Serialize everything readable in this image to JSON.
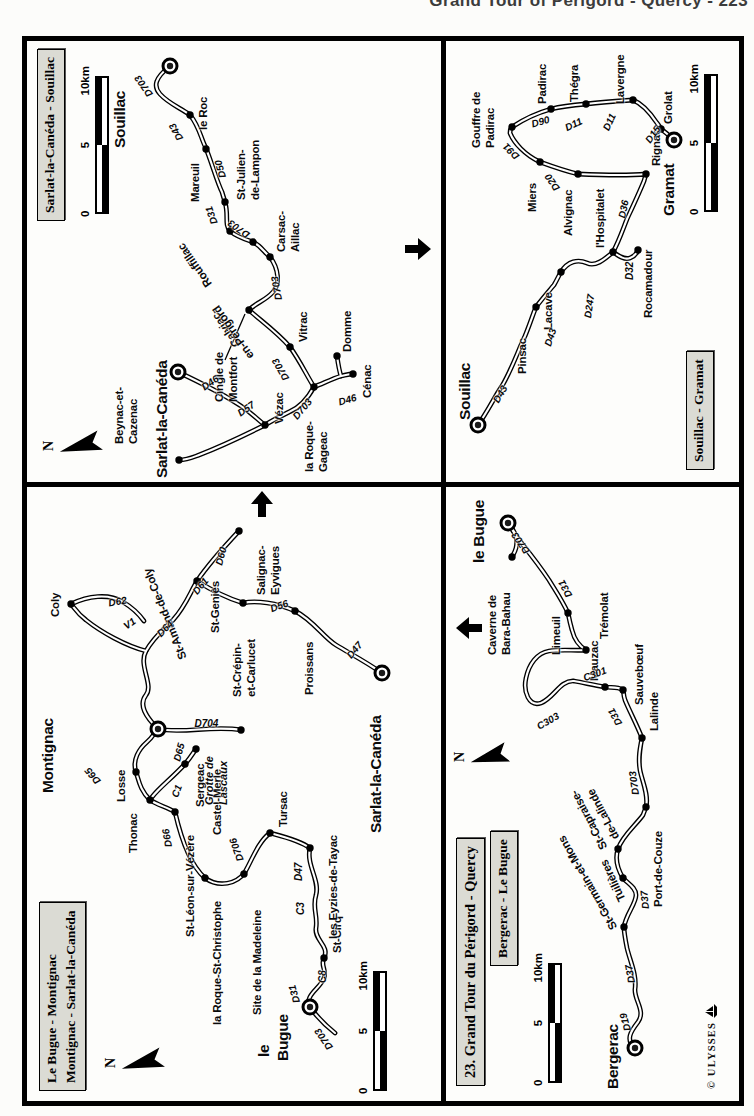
{
  "header": "Grand Tour of Périgord - Quercy - 223",
  "credit": "© ULYSSES",
  "colors": {
    "ink": "#000000",
    "paper": "#fdfdfb",
    "title_box": "#dbdbd4"
  },
  "maps": {
    "q1": {
      "name": "le-bugue-montignac-sarlat",
      "titles": [
        "Le Bugue - Montignac",
        "Montignac - Sarlat-la-Canéda"
      ],
      "scale": [
        "0",
        "5",
        "10km"
      ],
      "compass": "N",
      "towns": [
        {
          "n": "le Bugue",
          "x": 94,
          "y": 283,
          "k": "big"
        },
        {
          "n": "Montignac",
          "x": 372,
          "y": 131,
          "k": "big"
        },
        {
          "n": "Sarlat-la-Canéda",
          "x": 428,
          "y": 355,
          "k": "big"
        },
        {
          "n": "St-Cirq",
          "x": 143,
          "y": 297
        },
        {
          "n": "les Eyzies-de-Tayac",
          "x": 253,
          "y": 283
        },
        {
          "n": "Tursac",
          "x": 268,
          "y": 243
        },
        {
          "n": "Site de la Madeleine",
          "x": 227,
          "y": 217
        },
        {
          "n": "la Roque-St-Christophe",
          "x": 223,
          "y": 178
        },
        {
          "n": "St-Léon-sur-Vézère",
          "x": 289,
          "y": 148
        },
        {
          "n": "Thonac",
          "x": 301,
          "y": 123
        },
        {
          "n": "Losse",
          "x": 329,
          "y": 109
        },
        {
          "n": "Sergeac",
          "x": 337,
          "y": 158
        },
        {
          "n": "Castel-Merle",
          "x": 352,
          "y": 169
        },
        {
          "n": "Grotte de Lascaux",
          "x": 371,
          "y": 214
        },
        {
          "n": "Coly",
          "x": 497,
          "y": 44
        },
        {
          "n": "St-Geniès",
          "x": 520,
          "y": 170
        },
        {
          "n": "St-Crépin-et-Carlucet",
          "x": 498,
          "y": 216
        },
        {
          "n": "Salignac-Eyvigues",
          "x": 570,
          "y": 212
        },
        {
          "n": "Proissans",
          "x": 490,
          "y": 268
        }
      ],
      "labels": [
        {
          "t": "le",
          "x": 44,
          "y": 228,
          "c": "big"
        },
        {
          "t": "Bugue",
          "x": 40,
          "y": 247,
          "c": "big"
        },
        {
          "t": "Montignac",
          "x": 308,
          "y": 12,
          "c": "big"
        },
        {
          "t": "Sarlat-la-Canéda",
          "x": 268,
          "y": 340,
          "c": "big"
        },
        {
          "t": "St-Cirq",
          "x": 148,
          "y": 304
        },
        {
          "t": "les Eyzies-de-Tayac",
          "x": 162,
          "y": 300
        },
        {
          "t": "Tursac",
          "x": 274,
          "y": 250
        },
        {
          "t": "Site de la Madeleine",
          "x": 86,
          "y": 224
        },
        {
          "t": "la Roque-St-Christophe",
          "x": 76,
          "y": 184
        },
        {
          "t": "St-Léon-sur-Vézère",
          "x": 164,
          "y": 157
        },
        {
          "t": "Thonac",
          "x": 248,
          "y": 100
        },
        {
          "t": "Losse",
          "x": 299,
          "y": 88
        },
        {
          "t": "Sergeac",
          "x": 294,
          "y": 167
        },
        {
          "t": "Castel-Merle",
          "x": 266,
          "y": 184
        },
        {
          "t": "Coly",
          "x": 484,
          "y": 22
        },
        {
          "t": "St-Amand-de-Coly",
          "x": 442,
          "y": 150,
          "r": -22
        },
        {
          "t": "St-Geniès",
          "x": 468,
          "y": 182
        },
        {
          "t": "Salignac-",
          "x": 506,
          "y": 228
        },
        {
          "t": "Eyvigues",
          "x": 506,
          "y": 242
        },
        {
          "t": "St-Crépin-",
          "x": 404,
          "y": 204
        },
        {
          "t": "et-Carlucet",
          "x": 404,
          "y": 218
        },
        {
          "t": "Proissans",
          "x": 406,
          "y": 276
        },
        {
          "t": "Grotte de",
          "x": 296,
          "y": 176,
          "c": "site"
        },
        {
          "t": "Lascaux",
          "x": 296,
          "y": 190,
          "c": "site"
        },
        {
          "t": "D703",
          "x": 52,
          "y": 298,
          "c": "road",
          "r": -35
        },
        {
          "t": "D31",
          "x": 98,
          "y": 264,
          "c": "road",
          "r": -15
        },
        {
          "t": "C8",
          "x": 118,
          "y": 290,
          "c": "road"
        },
        {
          "t": "C3",
          "x": 186,
          "y": 268,
          "c": "road"
        },
        {
          "t": "D47",
          "x": 220,
          "y": 266,
          "c": "road"
        },
        {
          "t": "D706",
          "x": 240,
          "y": 208,
          "c": "road",
          "r": -20
        },
        {
          "t": "D66",
          "x": 254,
          "y": 136,
          "c": "road",
          "r": -10
        },
        {
          "t": "C1",
          "x": 304,
          "y": 142,
          "c": "road",
          "r": 20
        },
        {
          "t": "D65",
          "x": 340,
          "y": 144,
          "c": "road",
          "r": 15
        },
        {
          "t": "D65",
          "x": 318,
          "y": 66,
          "c": "road",
          "r": -40
        },
        {
          "t": "D704",
          "x": 378,
          "y": 162,
          "c": "road",
          "r": 90
        },
        {
          "t": "D62",
          "x": 498,
          "y": 76,
          "c": "road",
          "r": 80
        },
        {
          "t": "V1",
          "x": 474,
          "y": 92,
          "c": "road",
          "r": 55
        },
        {
          "t": "D64",
          "x": 466,
          "y": 126,
          "c": "road",
          "r": 45
        },
        {
          "t": "D61",
          "x": 508,
          "y": 162,
          "c": "road",
          "r": 40
        },
        {
          "t": "D60",
          "x": 536,
          "y": 186,
          "c": "road",
          "r": 15
        },
        {
          "t": "D56",
          "x": 492,
          "y": 238,
          "c": "road",
          "r": 70
        },
        {
          "t": "D47",
          "x": 444,
          "y": 316,
          "c": "road",
          "r": 40
        }
      ]
    },
    "q2": {
      "name": "sarlat-souillac",
      "titles": [
        "Sarlat-la-Canéda - Souillac"
      ],
      "scale": [
        "0",
        "5",
        "10km"
      ],
      "compass": "N",
      "towns": [
        {
          "n": "Souillac",
          "x": 416,
          "y": 143,
          "k": "big"
        },
        {
          "n": "Sarlat-la-Canéda",
          "x": 110,
          "y": 151,
          "k": "big"
        },
        {
          "n": "le Roc",
          "x": 367,
          "y": 163
        },
        {
          "n": "Mareuil",
          "x": 333,
          "y": 179
        },
        {
          "n": "St-Julien-de-Lampon",
          "x": 280,
          "y": 198
        },
        {
          "n": "Rouffillac",
          "x": 251,
          "y": 203
        },
        {
          "n": "Calviac-en-Périgord",
          "x": 240,
          "y": 226
        },
        {
          "n": "Carsac-Aillac",
          "x": 225,
          "y": 243
        },
        {
          "n": "Cingle de Montfort",
          "x": 172,
          "y": 222
        },
        {
          "n": "Vitrac",
          "x": 135,
          "y": 263
        },
        {
          "n": "la Roque-Gageac",
          "x": 95,
          "y": 287
        },
        {
          "n": "Cénac",
          "x": 108,
          "y": 326
        },
        {
          "n": "Domme",
          "x": 126,
          "y": 310
        },
        {
          "n": "Vézac",
          "x": 57,
          "y": 238
        },
        {
          "n": "Beynac-et-Cazenac",
          "x": 22,
          "y": 152
        }
      ],
      "labels": [
        {
          "t": "Souillac",
          "x": 334,
          "y": 84,
          "c": "big"
        },
        {
          "t": "Sarlat-la-Canéda",
          "x": 4,
          "y": 126,
          "c": "big"
        },
        {
          "t": "le Roc",
          "x": 352,
          "y": 170
        },
        {
          "t": "Mareuil",
          "x": 280,
          "y": 162
        },
        {
          "t": "St-Julien-",
          "x": 282,
          "y": 208
        },
        {
          "t": "de-Lampon",
          "x": 282,
          "y": 222
        },
        {
          "t": "Rouffillac",
          "x": 196,
          "y": 176,
          "r": -35
        },
        {
          "t": "Calviac-",
          "x": 136,
          "y": 204,
          "r": -35
        },
        {
          "t": "en-Périgord",
          "x": 124,
          "y": 218,
          "r": -35
        },
        {
          "t": "Carsac-",
          "x": 230,
          "y": 248
        },
        {
          "t": "Aillac",
          "x": 230,
          "y": 262
        },
        {
          "t": "Cingle de",
          "x": 80,
          "y": 186
        },
        {
          "t": "Montfort",
          "x": 80,
          "y": 200
        },
        {
          "t": "Vitrac",
          "x": 140,
          "y": 270
        },
        {
          "t": "Domme",
          "x": 130,
          "y": 314
        },
        {
          "t": "Cénac",
          "x": 84,
          "y": 334
        },
        {
          "t": "la Roque-",
          "x": 10,
          "y": 276
        },
        {
          "t": "Gageac",
          "x": 10,
          "y": 290
        },
        {
          "t": "Vézac",
          "x": 58,
          "y": 246
        },
        {
          "t": "Beynac-et-",
          "x": 38,
          "y": 86
        },
        {
          "t": "Cazenac",
          "x": 38,
          "y": 100
        },
        {
          "t": "D703",
          "x": 386,
          "y": 118,
          "c": "road",
          "r": -35
        },
        {
          "t": "D43",
          "x": 342,
          "y": 148,
          "c": "road",
          "r": -30
        },
        {
          "t": "D50",
          "x": 304,
          "y": 190,
          "c": "road",
          "r": -15
        },
        {
          "t": "D31",
          "x": 258,
          "y": 182,
          "c": "road",
          "r": -20
        },
        {
          "t": "D703",
          "x": 246,
          "y": 216,
          "c": "road",
          "r": -55
        },
        {
          "t": "D703",
          "x": 182,
          "y": 246,
          "c": "road",
          "r": -10
        },
        {
          "t": "D703",
          "x": 102,
          "y": 254,
          "c": "road",
          "r": -30
        },
        {
          "t": "D703",
          "x": 64,
          "y": 262,
          "c": "road",
          "r": 40
        },
        {
          "t": "D46",
          "x": 94,
          "y": 170,
          "c": "road",
          "r": 55
        },
        {
          "t": "D57",
          "x": 68,
          "y": 206,
          "c": "road",
          "r": 55
        },
        {
          "t": "D46",
          "x": 80,
          "y": 306,
          "c": "road",
          "r": 75
        }
      ]
    },
    "q3": {
      "name": "bergerac-le-bugue",
      "titles": [
        "23. Grand Tour du Périgord - Quercy",
        "Bergerac - Le Bugue"
      ],
      "scale": [
        "0",
        "5",
        "10km"
      ],
      "compass": "N",
      "towns": [
        {
          "n": "Bergerac",
          "x": 53,
          "y": 189,
          "k": "big"
        },
        {
          "n": "le Bugue",
          "x": 578,
          "y": 62,
          "k": "big"
        },
        {
          "n": "St-Germain-et-Mons",
          "x": 174,
          "y": 178
        },
        {
          "n": "Tuilières",
          "x": 223,
          "y": 177
        },
        {
          "n": "St-Capraise-de-Lalinde",
          "x": 252,
          "y": 172
        },
        {
          "n": "Port-de-Couze",
          "x": 294,
          "y": 200
        },
        {
          "n": "Lalinde",
          "x": 363,
          "y": 196
        },
        {
          "n": "Sauvebœuf",
          "x": 411,
          "y": 177
        },
        {
          "n": "Mauzac",
          "x": 414,
          "y": 159
        },
        {
          "n": "Trémolat",
          "x": 451,
          "y": 140
        },
        {
          "n": "Limeuil",
          "x": 488,
          "y": 122
        },
        {
          "n": "Caverne de Bara-Bahau",
          "x": 544,
          "y": 66
        }
      ],
      "labels": [
        {
          "t": "Bergerac",
          "x": 12,
          "y": 158,
          "c": "big"
        },
        {
          "t": "le Bugue",
          "x": 538,
          "y": 24,
          "c": "big"
        },
        {
          "t": "St-Germain-et-Mons",
          "x": 172,
          "y": 162,
          "r": -30
        },
        {
          "t": "Tuilières",
          "x": 200,
          "y": 170,
          "r": -25
        },
        {
          "t": "St-Capraise-",
          "x": 252,
          "y": 152,
          "r": -28
        },
        {
          "t": "de-Lalinde",
          "x": 262,
          "y": 164,
          "r": -28
        },
        {
          "t": "Port-de-Couze",
          "x": 194,
          "y": 206
        },
        {
          "t": "Lalinde",
          "x": 370,
          "y": 202
        },
        {
          "t": "Sauvebœuf",
          "x": 396,
          "y": 187
        },
        {
          "t": "Mauzac",
          "x": 420,
          "y": 142
        },
        {
          "t": "Trémolat",
          "x": 462,
          "y": 152
        },
        {
          "t": "Limeuil",
          "x": 446,
          "y": 104
        },
        {
          "t": "Caverne de",
          "x": 446,
          "y": 40
        },
        {
          "t": "Bara-Bahau",
          "x": 446,
          "y": 54
        },
        {
          "t": "D19",
          "x": 70,
          "y": 176,
          "c": "road",
          "r": -15
        },
        {
          "t": "D37",
          "x": 118,
          "y": 180,
          "c": "road",
          "r": -10
        },
        {
          "t": "D37",
          "x": 192,
          "y": 194,
          "c": "road",
          "r": -5
        },
        {
          "t": "D703",
          "x": 306,
          "y": 184,
          "c": "road",
          "r": -8
        },
        {
          "t": "D31",
          "x": 376,
          "y": 168,
          "c": "road",
          "r": -30
        },
        {
          "t": "C301",
          "x": 423,
          "y": 132,
          "c": "road",
          "r": 70
        },
        {
          "t": "C303",
          "x": 374,
          "y": 86,
          "c": "road",
          "r": 60
        },
        {
          "t": "D31",
          "x": 504,
          "y": 118,
          "c": "road",
          "r": -28
        },
        {
          "t": "D703",
          "x": 548,
          "y": 76,
          "c": "road",
          "r": -35
        }
      ]
    },
    "q4": {
      "name": "souillac-gramat",
      "titles": [
        "Souillac - Gramat"
      ],
      "scale": [
        "0",
        "5",
        "10km"
      ],
      "towns": [
        {
          "n": "Souillac",
          "x": 57,
          "y": 32,
          "k": "big"
        },
        {
          "n": "Gramat",
          "x": 342,
          "y": 228,
          "k": "big"
        },
        {
          "n": "Pinsac",
          "x": 175,
          "y": 90
        },
        {
          "n": "Lacave",
          "x": 210,
          "y": 115
        },
        {
          "n": "l'Hospitalet",
          "x": 230,
          "y": 167
        },
        {
          "n": "Rocamadour",
          "x": 232,
          "y": 192
        },
        {
          "n": "Rignac",
          "x": 308,
          "y": 200
        },
        {
          "n": "Alvignac",
          "x": 308,
          "y": 132
        },
        {
          "n": "Miers",
          "x": 320,
          "y": 94
        },
        {
          "n": "Gouffre de Padirac",
          "x": 355,
          "y": 66
        },
        {
          "n": "Padirac",
          "x": 373,
          "y": 105
        },
        {
          "n": "Thégra",
          "x": 378,
          "y": 140
        },
        {
          "n": "Lavergne",
          "x": 382,
          "y": 187
        },
        {
          "n": "Grolat",
          "x": 353,
          "y": 215
        }
      ],
      "labels": [
        {
          "t": "Souillac",
          "x": 62,
          "y": 10,
          "c": "big"
        },
        {
          "t": "Gramat",
          "x": 266,
          "y": 214,
          "c": "big"
        },
        {
          "t": "Pinsac",
          "x": 108,
          "y": 70
        },
        {
          "t": "Lacave",
          "x": 152,
          "y": 96
        },
        {
          "t": "l'Hospitalet",
          "x": 234,
          "y": 148
        },
        {
          "t": "Rocamadour",
          "x": 164,
          "y": 196
        },
        {
          "t": "Rignac",
          "x": 316,
          "y": 204
        },
        {
          "t": "Alvignac",
          "x": 246,
          "y": 116
        },
        {
          "t": "Miers",
          "x": 270,
          "y": 80
        },
        {
          "t": "Gouffre de",
          "x": 334,
          "y": 24
        },
        {
          "t": "Padirac",
          "x": 334,
          "y": 38
        },
        {
          "t": "Padirac",
          "x": 378,
          "y": 90
        },
        {
          "t": "Thégra",
          "x": 380,
          "y": 122
        },
        {
          "t": "Lavergne",
          "x": 378,
          "y": 168
        },
        {
          "t": "Grolat",
          "x": 358,
          "y": 216
        },
        {
          "t": "D43",
          "x": 80,
          "y": 44,
          "c": "road",
          "r": 30
        },
        {
          "t": "D43",
          "x": 136,
          "y": 96,
          "c": "road",
          "r": 18
        },
        {
          "t": "D247",
          "x": 164,
          "y": 136,
          "c": "road",
          "r": 8
        },
        {
          "t": "D32",
          "x": 202,
          "y": 178,
          "c": "road"
        },
        {
          "t": "D36",
          "x": 264,
          "y": 170,
          "c": "road",
          "r": 12
        },
        {
          "t": "D20",
          "x": 292,
          "y": 106,
          "c": "road",
          "r": -35
        },
        {
          "t": "D91",
          "x": 324,
          "y": 66,
          "c": "road",
          "r": -45
        },
        {
          "t": "D90",
          "x": 358,
          "y": 80,
          "c": "road",
          "r": 75
        },
        {
          "t": "D11",
          "x": 354,
          "y": 114,
          "c": "road",
          "r": 65
        },
        {
          "t": "D11",
          "x": 352,
          "y": 154,
          "c": "road",
          "r": 25
        },
        {
          "t": "D15",
          "x": 340,
          "y": 196,
          "c": "road",
          "r": 35
        }
      ]
    }
  }
}
